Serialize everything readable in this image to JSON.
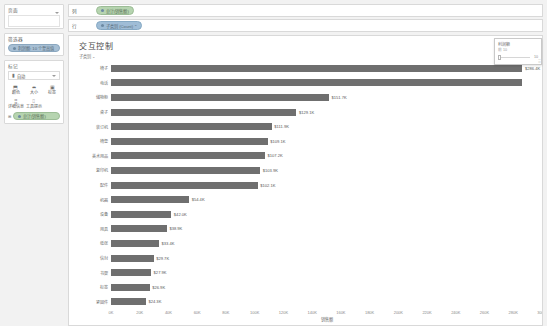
{
  "sidebar": {
    "pages": {
      "title": "页面",
      "field_value": ""
    },
    "filters": {
      "title": "筛选器",
      "pills": [
        {
          "icon": "filter-dot",
          "label": "利润额: 10 个至高值"
        }
      ]
    },
    "marks": {
      "title": "标记",
      "type_selector": {
        "icon": "bar-icon",
        "value": "自动"
      },
      "buttons": [
        {
          "icon": "color-icon",
          "glyph": "⬒",
          "label": "颜色"
        },
        {
          "icon": "size-icon",
          "glyph": "⬌",
          "label": "大小"
        },
        {
          "icon": "label-icon",
          "glyph": "▣",
          "label": "标签"
        },
        {
          "icon": "detail-icon",
          "glyph": "⣿",
          "label": "详细信息"
        },
        {
          "icon": "tooltip-icon",
          "glyph": "⌷",
          "label": "工具提示"
        }
      ],
      "detail_pill": {
        "icon": "abc-icon",
        "label": "总计(销售额)"
      }
    }
  },
  "shelves": [
    {
      "name": "columns",
      "label": "列",
      "pills": [
        {
          "icon": "measure-dot",
          "label": "总计(销售额)",
          "color": "green"
        }
      ]
    },
    {
      "name": "rows",
      "label": "行",
      "pills": [
        {
          "icon": "dimension-dot",
          "label": "子类别 (Count) ⌃",
          "color": "blue"
        }
      ]
    }
  ],
  "worksheet": {
    "title": "交互控制",
    "axis_corner_label": "子类别 ⌄"
  },
  "filter_card": {
    "title": "利润额",
    "subtitle": "前 10",
    "min_label": "前",
    "value": "10"
  },
  "colors": {
    "bar": "#6f6f6f",
    "panel_bg": "#f2f2f2",
    "pill_blue": "#9fbdd6",
    "pill_green": "#b6d4b0"
  },
  "chart_data": {
    "type": "bar",
    "orientation": "horizontal",
    "title": "交互控制",
    "xlabel": "销售额",
    "ylabel": "子类别",
    "xlim": [
      0,
      300000
    ],
    "grid": false,
    "legend": "none",
    "categories": [
      "椅子",
      "电话",
      "储物柜",
      "桌子",
      "装订机",
      "椅垫",
      "美术用品",
      "复印机",
      "配件",
      "机器",
      "设备",
      "用具",
      "纸张",
      "信封",
      "书架",
      "标签",
      "紧固件"
    ],
    "tick_labels": [
      "0K",
      "20K",
      "40K",
      "60K",
      "80K",
      "100K",
      "120K",
      "140K",
      "160K",
      "180K",
      "200K",
      "220K",
      "240K",
      "260K",
      "280K",
      "300K"
    ],
    "tick_values": [
      0,
      20000,
      40000,
      60000,
      80000,
      100000,
      120000,
      140000,
      160000,
      180000,
      200000,
      220000,
      240000,
      260000,
      280000,
      300000
    ],
    "values": [
      286400,
      286000,
      151700,
      129100,
      111900,
      109100,
      107200,
      103900,
      102100,
      54400,
      42000,
      38900,
      33400,
      29700,
      27900,
      26900,
      24300
    ],
    "value_labels": [
      "$286.4K",
      "",
      "$151.7K",
      "$129.1K",
      "$111.9K",
      "$109.1K",
      "$107.2K",
      "$103.9K",
      "$102.1K",
      "$54.4K",
      "$42.0K",
      "$38.9K",
      "$33.4K",
      "$29.7K",
      "$27.9K",
      "$26.9K",
      "$24.3K"
    ]
  }
}
